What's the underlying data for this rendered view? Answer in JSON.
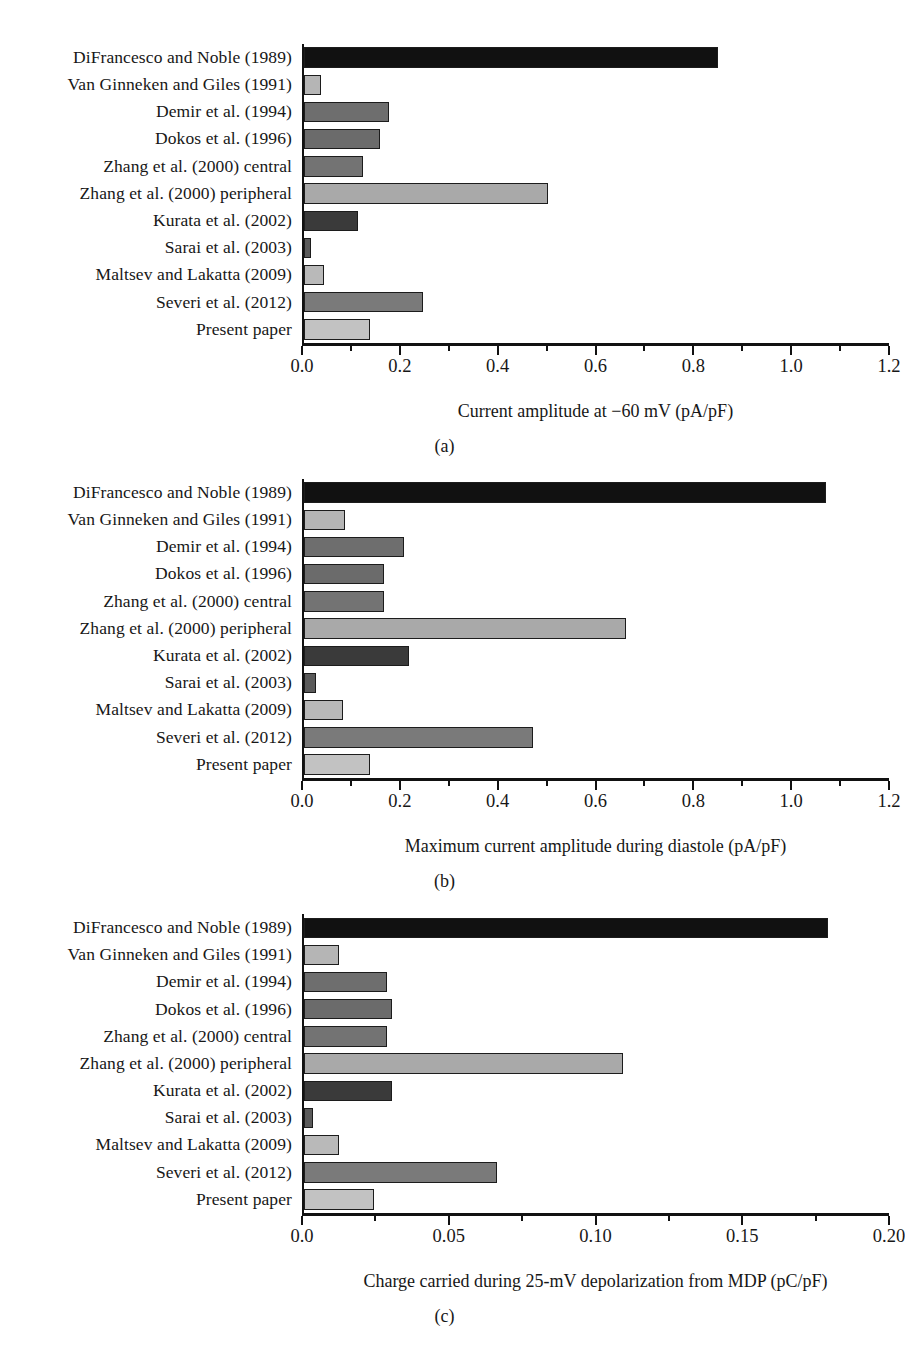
{
  "figure": {
    "categories": [
      "DiFrancesco and Noble (1989)",
      "Van Ginneken and Giles (1991)",
      "Demir et al. (1994)",
      "Dokos et al. (1996)",
      "Zhang et al. (2000) central",
      "Zhang et al. (2000) peripheral",
      "Kurata et al. (2002)",
      "Sarai et al. (2003)",
      "Maltsev and Lakatta (2009)",
      "Severi et al. (2012)",
      "Present paper"
    ],
    "bar_colors": [
      "#111111",
      "#b5b5b5",
      "#6e6e6e",
      "#6b6b6b",
      "#737373",
      "#a9a9a9",
      "#3a3a3a",
      "#5a5a5a",
      "#b9b9b9",
      "#7a7a7a",
      "#c2c2c2"
    ],
    "axis_color": "#111111",
    "bar_border_color": "#1c1c1c"
  },
  "chart_data": [
    {
      "type": "bar",
      "orientation": "horizontal",
      "panel": "a",
      "caption": "(a)",
      "title": "",
      "xlabel": "Current amplitude at −60 mV (pA/pF)",
      "ylabel": "",
      "xlim": [
        0.0,
        1.2
      ],
      "xticks": [
        0.0,
        0.2,
        0.4,
        0.6,
        0.8,
        1.0,
        1.2
      ],
      "xticklabels": [
        "0.0",
        "0.2",
        "0.4",
        "0.6",
        "0.8",
        "1.0",
        "1.2"
      ],
      "minor_tick_step": 0.1,
      "grid": false,
      "legend": "none",
      "categories": [
        "DiFrancesco and Noble (1989)",
        "Van Ginneken and Giles (1991)",
        "Demir et al. (1994)",
        "Dokos et al. (1996)",
        "Zhang et al. (2000) central",
        "Zhang et al. (2000) peripheral",
        "Kurata et al. (2002)",
        "Sarai et al. (2003)",
        "Maltsev and Lakatta (2009)",
        "Severi et al. (2012)",
        "Present paper"
      ],
      "values": [
        0.85,
        0.035,
        0.175,
        0.155,
        0.12,
        0.5,
        0.11,
        0.015,
        0.04,
        0.245,
        0.135
      ]
    },
    {
      "type": "bar",
      "orientation": "horizontal",
      "panel": "b",
      "caption": "(b)",
      "title": "",
      "xlabel": "Maximum current amplitude during diastole (pA/pF)",
      "ylabel": "",
      "xlim": [
        0.0,
        1.2
      ],
      "xticks": [
        0.0,
        0.2,
        0.4,
        0.6,
        0.8,
        1.0,
        1.2
      ],
      "xticklabels": [
        "0.0",
        "0.2",
        "0.4",
        "0.6",
        "0.8",
        "1.0",
        "1.2"
      ],
      "minor_tick_step": 0.1,
      "grid": false,
      "legend": "none",
      "categories": [
        "DiFrancesco and Noble (1989)",
        "Van Ginneken and Giles (1991)",
        "Demir et al. (1994)",
        "Dokos et al. (1996)",
        "Zhang et al. (2000) central",
        "Zhang et al. (2000) peripheral",
        "Kurata et al. (2002)",
        "Sarai et al. (2003)",
        "Maltsev and Lakatta (2009)",
        "Severi et al. (2012)",
        "Present paper"
      ],
      "values": [
        1.07,
        0.085,
        0.205,
        0.165,
        0.165,
        0.66,
        0.215,
        0.025,
        0.08,
        0.47,
        0.135
      ]
    },
    {
      "type": "bar",
      "orientation": "horizontal",
      "panel": "c",
      "caption": "(c)",
      "title": "",
      "xlabel": "Charge carried during 25-mV depolarization from MDP (pC/pF)",
      "ylabel": "",
      "xlim": [
        0.0,
        0.2
      ],
      "xticks": [
        0.0,
        0.05,
        0.1,
        0.15,
        0.2
      ],
      "xticklabels": [
        "0.0",
        "0.05",
        "0.10",
        "0.15",
        "0.20"
      ],
      "minor_tick_step": 0.025,
      "grid": false,
      "legend": "none",
      "categories": [
        "DiFrancesco and Noble (1989)",
        "Van Ginneken and Giles (1991)",
        "Demir et al. (1994)",
        "Dokos et al. (1996)",
        "Zhang et al. (2000) central",
        "Zhang et al. (2000) peripheral",
        "Kurata et al. (2002)",
        "Sarai et al. (2003)",
        "Maltsev and Lakatta (2009)",
        "Severi et al. (2012)",
        "Present paper"
      ],
      "values": [
        0.179,
        0.012,
        0.0285,
        0.03,
        0.0285,
        0.109,
        0.03,
        0.003,
        0.012,
        0.066,
        0.024
      ]
    }
  ]
}
